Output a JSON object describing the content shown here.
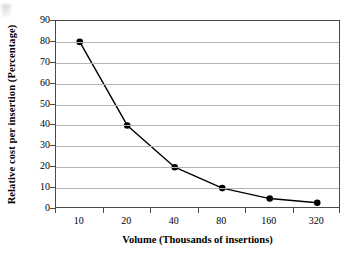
{
  "chart_data": {
    "type": "line",
    "title": "",
    "xlabel": "Volume (Thousands of insertions)",
    "ylabel": "Relative cost per insertion (Percentage)",
    "categories": [
      "10",
      "20",
      "40",
      "80",
      "160",
      "320"
    ],
    "values": [
      80,
      40,
      20,
      10,
      5,
      3
    ],
    "series": [
      {
        "name": "Relative cost per insertion",
        "values": [
          80,
          40,
          20,
          10,
          5,
          3
        ]
      }
    ],
    "ylim": [
      0,
      90
    ],
    "yticks": [
      0,
      10,
      20,
      30,
      40,
      50,
      60,
      70,
      80,
      90
    ],
    "ytick_labels": [
      "0",
      "10",
      "20",
      "30",
      "40",
      "50",
      "60",
      "70",
      "80",
      "90"
    ],
    "grid": "horizontal",
    "legend": "none",
    "marker": "filled-circle",
    "marker_color": "#000000",
    "line_color": "#000000",
    "gridline_color": "#b4b4b4",
    "frame_color": "#4a4a4a",
    "background_color": "#ffffff"
  }
}
